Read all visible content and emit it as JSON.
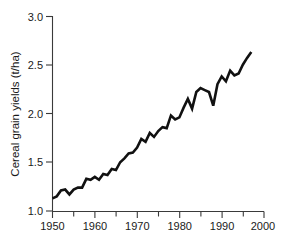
{
  "chart_data": {
    "type": "line",
    "title": "",
    "subtitle": "",
    "xlabel": "",
    "ylabel": "Cereal grain yields (t/ha)",
    "xlim": [
      1950,
      2000
    ],
    "ylim": [
      1.0,
      3.0
    ],
    "grid": false,
    "legend": null,
    "x_ticks": [
      1950,
      1960,
      1970,
      1980,
      1990,
      2000
    ],
    "x_tick_labels": [
      "1950",
      "1960",
      "1970",
      "1980",
      "1990",
      "2000"
    ],
    "x_minor_ticks": [
      1955,
      1965,
      1975,
      1985,
      1995
    ],
    "y_ticks": [
      1.0,
      1.5,
      2.0,
      2.5,
      3.0
    ],
    "y_tick_labels": [
      "1.0",
      "1.5",
      "2.0",
      "2.5",
      "3.0"
    ],
    "series": [
      {
        "name": "Cereal grain yields",
        "color": "#111111",
        "x": [
          1950,
          1951,
          1952,
          1953,
          1954,
          1955,
          1956,
          1957,
          1958,
          1959,
          1960,
          1961,
          1962,
          1963,
          1964,
          1965,
          1966,
          1967,
          1968,
          1969,
          1970,
          1971,
          1972,
          1973,
          1974,
          1975,
          1976,
          1977,
          1978,
          1979,
          1980,
          1981,
          1982,
          1983,
          1984,
          1985,
          1986,
          1987,
          1988,
          1989,
          1990,
          1991,
          1992,
          1993,
          1994,
          1995,
          1996,
          1997
        ],
        "values": [
          1.13,
          1.15,
          1.21,
          1.22,
          1.17,
          1.22,
          1.24,
          1.24,
          1.33,
          1.32,
          1.35,
          1.32,
          1.38,
          1.37,
          1.43,
          1.42,
          1.5,
          1.54,
          1.59,
          1.6,
          1.65,
          1.74,
          1.71,
          1.8,
          1.76,
          1.82,
          1.86,
          1.85,
          1.98,
          1.94,
          1.96,
          2.06,
          2.15,
          2.05,
          2.22,
          2.26,
          2.24,
          2.22,
          2.08,
          2.3,
          2.38,
          2.33,
          2.44,
          2.39,
          2.41,
          2.5,
          2.57,
          2.63
        ],
        "notes": "Steadily rising, strongly sawtoothed annual series; pronounced dip at 1988 and a local high near 1985."
      }
    ]
  },
  "axes": {
    "y_axis_title": "Cereal grain yields (t/ha)"
  }
}
